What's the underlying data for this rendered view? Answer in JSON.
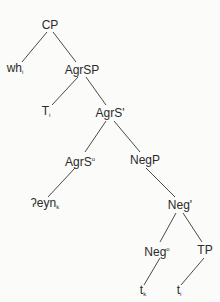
{
  "diagram": {
    "type": "syntax-tree",
    "nodes": {
      "cp": {
        "label": "CP",
        "sub": "",
        "sup": ""
      },
      "wh": {
        "label": "wh",
        "sub": "i",
        "sup": ""
      },
      "agrsp": {
        "label": "AgrSP",
        "sub": "",
        "sup": ""
      },
      "t_upper": {
        "label": "T",
        "sub": "i",
        "sup": ""
      },
      "agrs_bar": {
        "label": "AgrS'",
        "sub": "",
        "sup": ""
      },
      "agrs_zero": {
        "label": "AgrS",
        "sub": "",
        "sup": "o"
      },
      "negp": {
        "label": "NegP",
        "sub": "",
        "sup": ""
      },
      "eyn": {
        "label": "ʔeyn",
        "sub": "k",
        "sup": ""
      },
      "neg_bar": {
        "label": "Neg'",
        "sub": "",
        "sup": ""
      },
      "neg_zero": {
        "label": "Neg",
        "sub": "",
        "sup": "o"
      },
      "tp": {
        "label": "TP",
        "sub": "",
        "sup": ""
      },
      "t_k": {
        "label": "t",
        "sub": "k",
        "sup": ""
      },
      "t_i": {
        "label": "t",
        "sub": "i",
        "sup": ""
      }
    },
    "edges": [
      [
        "cp",
        "wh"
      ],
      [
        "cp",
        "agrsp"
      ],
      [
        "agrsp",
        "t_upper"
      ],
      [
        "agrsp",
        "agrs_bar"
      ],
      [
        "agrs_bar",
        "agrs_zero"
      ],
      [
        "agrs_bar",
        "negp"
      ],
      [
        "agrs_zero",
        "eyn"
      ],
      [
        "negp",
        "neg_bar"
      ],
      [
        "neg_bar",
        "neg_zero"
      ],
      [
        "neg_bar",
        "tp"
      ],
      [
        "neg_zero",
        "t_k"
      ],
      [
        "tp",
        "t_i"
      ]
    ]
  }
}
